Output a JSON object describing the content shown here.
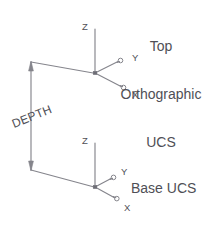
{
  "diagram": {
    "background_color": "#ffffff",
    "line_color": "#85858c",
    "text_color": "#4f4f56"
  },
  "captions": {
    "top_ucs": {
      "line1": "Top",
      "line2": "Orthographic",
      "line3": "UCS"
    },
    "base_ucs": "Base UCS"
  },
  "ucs_top": {
    "name": "Top Orthographic UCS",
    "origin": {
      "x": 95,
      "y": 73
    },
    "axes": [
      {
        "label": "Z",
        "dx": 0,
        "dy": -44,
        "label_x": 84,
        "label_y": 26
      },
      {
        "label": "Y",
        "dx": 26,
        "dy": -13,
        "label_x": 134,
        "label_y": 58
      },
      {
        "label": "X",
        "dx": 29,
        "dy": 15,
        "label_x": 134,
        "label_y": 94
      }
    ]
  },
  "ucs_base": {
    "name": "Base UCS",
    "origin": {
      "x": 95,
      "y": 187
    },
    "axes": [
      {
        "label": "Z",
        "dx": 0,
        "dy": -44,
        "label_x": 84,
        "label_y": 140
      },
      {
        "label": "Y",
        "dx": 26,
        "dy": -13,
        "label_x": 123,
        "label_y": 172
      },
      {
        "label": "X",
        "dx": 29,
        "dy": 15,
        "label_x": 126,
        "label_y": 208
      }
    ]
  },
  "dimension": {
    "label": "DEPTH",
    "label_x": 14,
    "label_y": 128,
    "label_rotation": -22,
    "line_x": 31,
    "top_y": 62,
    "bottom_y": 170,
    "extension_top": {
      "x1": 31,
      "y1": 62,
      "x2": 95,
      "y2": 73
    },
    "extension_bottom": {
      "x1": 31,
      "y1": 170,
      "x2": 95,
      "y2": 187
    }
  }
}
